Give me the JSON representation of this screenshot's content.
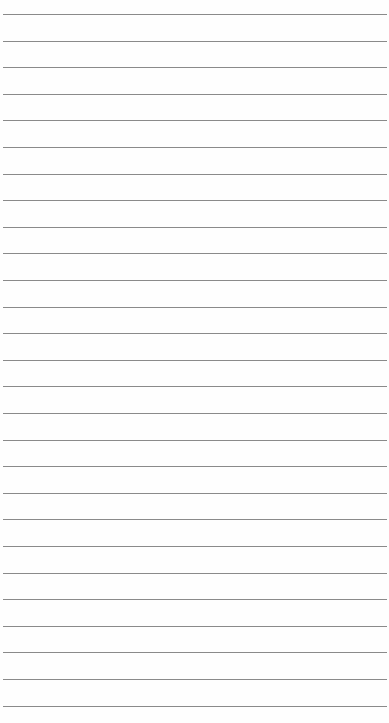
{
  "page": {
    "type": "lined-paper",
    "background_color": "#fefefe",
    "line_color": "#8a8a8a",
    "line_count": 27,
    "first_line_y": 14,
    "line_spacing": 26.6,
    "line_left": 3,
    "line_width": 384
  }
}
